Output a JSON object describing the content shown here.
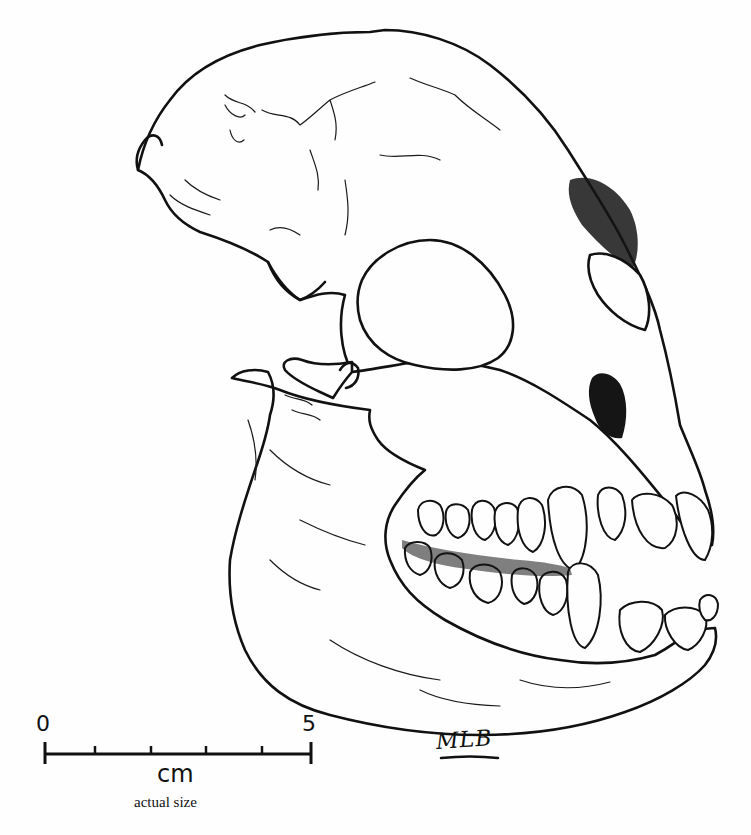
{
  "figure": {
    "ink_color": "#111111",
    "background_color": "#fefefe"
  },
  "scale_bar": {
    "start_label": "0",
    "end_label": "5",
    "unit": "cm",
    "caption": "actual size",
    "tick_count": 6
  },
  "signature": {
    "text": "MLB"
  }
}
